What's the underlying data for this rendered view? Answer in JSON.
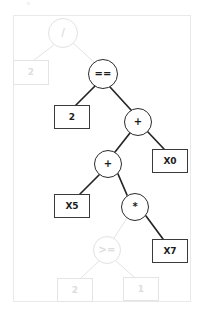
{
  "figure": {
    "panel_border_color": "#e9e9e9",
    "background_color": "#ffffff",
    "active_color": "#1c1c1c",
    "faded_color": "#dddddd"
  },
  "nodes": [
    {
      "id": "n0",
      "label": "/",
      "shape": "circle",
      "state": "faded",
      "cx": 63,
      "cy": 33,
      "r": 15
    },
    {
      "id": "n1",
      "label": "2",
      "shape": "rect",
      "state": "faded",
      "cx": 31,
      "cy": 72,
      "w": 36,
      "h": 25
    },
    {
      "id": "n2",
      "label": "==",
      "shape": "circle",
      "state": "active",
      "cx": 103,
      "cy": 74,
      "r": 15
    },
    {
      "id": "n3",
      "label": "2",
      "shape": "rect",
      "state": "active",
      "cx": 72,
      "cy": 117,
      "w": 36,
      "h": 24
    },
    {
      "id": "n4",
      "label": "+",
      "shape": "circle",
      "state": "active",
      "cx": 138,
      "cy": 122,
      "r": 14
    },
    {
      "id": "n5",
      "label": "+",
      "shape": "circle",
      "state": "active",
      "cx": 108,
      "cy": 164,
      "r": 14
    },
    {
      "id": "n6",
      "label": "X0",
      "shape": "rect",
      "state": "active",
      "cx": 170,
      "cy": 161,
      "w": 36,
      "h": 24
    },
    {
      "id": "n7",
      "label": "X5",
      "shape": "rect",
      "state": "active",
      "cx": 72,
      "cy": 206,
      "w": 36,
      "h": 24
    },
    {
      "id": "n8",
      "label": "*",
      "shape": "circle",
      "state": "active",
      "cx": 135,
      "cy": 207,
      "r": 14
    },
    {
      "id": "n9",
      "label": ">=",
      "shape": "circle",
      "state": "faded",
      "cx": 107,
      "cy": 250,
      "r": 14
    },
    {
      "id": "n10",
      "label": "X7",
      "shape": "rect",
      "state": "active",
      "cx": 170,
      "cy": 251,
      "w": 36,
      "h": 24
    },
    {
      "id": "n11",
      "label": "2",
      "shape": "rect",
      "state": "faded",
      "cx": 75,
      "cy": 290,
      "w": 36,
      "h": 24
    },
    {
      "id": "n12",
      "label": "1",
      "shape": "rect",
      "state": "faded",
      "cx": 141,
      "cy": 289,
      "w": 36,
      "h": 24
    }
  ],
  "edges": [
    {
      "from": "n0",
      "to": "n1",
      "state": "faded",
      "x1": 54,
      "y1": 45,
      "x2": 34,
      "y2": 60
    },
    {
      "from": "n0",
      "to": "n2",
      "state": "faded",
      "x1": 73,
      "y1": 43,
      "x2": 95,
      "y2": 63
    },
    {
      "from": "n2",
      "to": "n3",
      "state": "active",
      "x1": 95,
      "y1": 86,
      "x2": 76,
      "y2": 105
    },
    {
      "from": "n2",
      "to": "n4",
      "state": "active",
      "x1": 110,
      "y1": 87,
      "x2": 131,
      "y2": 110
    },
    {
      "from": "n4",
      "to": "n5",
      "state": "active",
      "x1": 130,
      "y1": 133,
      "x2": 115,
      "y2": 152
    },
    {
      "from": "n4",
      "to": "n6",
      "state": "active",
      "x1": 147,
      "y1": 131,
      "x2": 164,
      "y2": 149
    },
    {
      "from": "n5",
      "to": "n7",
      "state": "active",
      "x1": 99,
      "y1": 175,
      "x2": 80,
      "y2": 194
    },
    {
      "from": "n5",
      "to": "n8",
      "state": "active",
      "x1": 118,
      "y1": 174,
      "x2": 127,
      "y2": 195
    },
    {
      "from": "n8",
      "to": "n9",
      "state": "faded",
      "x1": 127,
      "y1": 218,
      "x2": 114,
      "y2": 238
    },
    {
      "from": "n8",
      "to": "n10",
      "state": "active",
      "x1": 146,
      "y1": 216,
      "x2": 163,
      "y2": 239
    },
    {
      "from": "n9",
      "to": "n11",
      "state": "faded",
      "x1": 99,
      "y1": 261,
      "x2": 81,
      "y2": 278
    },
    {
      "from": "n9",
      "to": "n12",
      "state": "faded",
      "x1": 116,
      "y1": 261,
      "x2": 134,
      "y2": 277
    }
  ]
}
